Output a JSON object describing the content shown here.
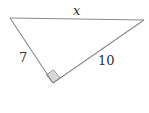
{
  "diagram": {
    "type": "right-triangle",
    "vertices": {
      "top_left": {
        "x": 10,
        "y": 18
      },
      "right": {
        "x": 144,
        "y": 20
      },
      "right_angle": {
        "x": 53,
        "y": 83
      }
    },
    "sides": [
      {
        "name": "hypotenuse",
        "label": "x",
        "italic": true
      },
      {
        "name": "left-leg",
        "label": "7",
        "italic": false
      },
      {
        "name": "right-leg",
        "label": "10",
        "italic": false
      }
    ],
    "right_angle_marker": true,
    "colors": {
      "stroke": "#888888",
      "marker_fill": "#d9d9d9",
      "text": "#333333"
    }
  }
}
